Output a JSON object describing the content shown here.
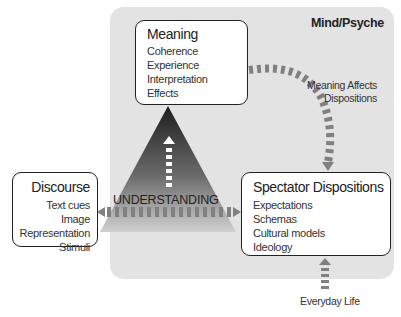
{
  "panel": {
    "title": "Mind/Psyche",
    "color": "#e3e3e3"
  },
  "meaning": {
    "title": "Meaning",
    "items": [
      "Coherence",
      "Experience",
      "Interpretation",
      "Effects"
    ]
  },
  "discourse": {
    "title": "Discourse",
    "items": [
      "Text cues",
      "Image",
      "Representation",
      "Stimuli"
    ]
  },
  "spectator": {
    "title": "Spectator Dispositions",
    "items": [
      "Expectations",
      "Schemas",
      "Cultural models",
      "Ideology"
    ]
  },
  "triangle": {
    "label": "UNDERSTANDING"
  },
  "arrows": {
    "meaning_to_spectator": {
      "label_line1": "Meaning Affects",
      "label_line2": "Dispositions"
    },
    "everyday": {
      "label": "Everyday Life"
    }
  },
  "colors": {
    "arrow": "#808080",
    "triangle_top": "#2a2a2a",
    "triangle_bottom": "#c8c8c8"
  }
}
